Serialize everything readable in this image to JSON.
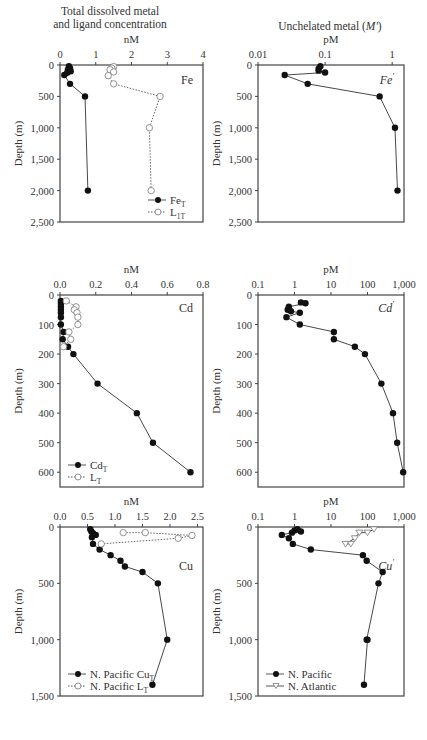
{
  "headers": {
    "left": [
      "Total dissolved metal",
      "and ligand concentration"
    ],
    "right_prefix": "Unchelated metal (",
    "right_symbol": "M'",
    "right_suffix": ")"
  },
  "chart_data": [
    {
      "id": "fe_total",
      "type": "line",
      "title": "Fe",
      "xlabel": "nM",
      "ylabel": "Depth (m)",
      "xscale": "linear",
      "xlim": [
        0,
        4
      ],
      "xticks": [
        0,
        1,
        2,
        3,
        4
      ],
      "ylim": [
        0,
        2500
      ],
      "yticks": [
        0,
        500,
        1000,
        1500,
        2000,
        2500
      ],
      "ytick_labels": [
        "0",
        "500",
        "1,000",
        "1,500",
        "2,000",
        "2,500"
      ],
      "legend_position": "lower right",
      "series": [
        {
          "name": "Fe_T",
          "marker": "filled-circle",
          "line": "solid",
          "x": [
            0.25,
            0.28,
            0.22,
            0.3,
            0.2,
            0.12,
            0.28,
            0.7,
            0.78
          ],
          "y": [
            20,
            50,
            75,
            100,
            125,
            160,
            300,
            500,
            2000
          ]
        },
        {
          "name": "L_1T",
          "marker": "open-circle",
          "line": "dotted",
          "x": [
            1.5,
            1.45,
            1.4,
            1.5,
            1.35,
            1.5,
            2.8,
            2.5,
            2.55
          ],
          "y": [
            25,
            50,
            75,
            110,
            170,
            300,
            500,
            1000,
            2000
          ]
        }
      ]
    },
    {
      "id": "fe_free",
      "type": "line",
      "title": "Fe'",
      "xlabel": "pM",
      "ylabel": "Depth (m)",
      "xscale": "log",
      "xlim": [
        0.01,
        1.5
      ],
      "xticks": [
        0.01,
        0.1,
        1
      ],
      "xtick_labels": [
        "0.01",
        "0.1",
        "1"
      ],
      "ylim": [
        0,
        2500
      ],
      "yticks": [
        0,
        500,
        1000,
        1500,
        2000,
        2500
      ],
      "ytick_labels": [
        "0",
        "500",
        "1,000",
        "1,500",
        "2,000",
        "2,500"
      ],
      "series": [
        {
          "name": "Fe'",
          "marker": "filled-circle",
          "line": "solid",
          "x": [
            0.085,
            0.08,
            0.08,
            0.1,
            0.025,
            0.055,
            0.65,
            1.1,
            1.2
          ],
          "y": [
            20,
            60,
            90,
            120,
            160,
            300,
            500,
            1000,
            2000
          ]
        }
      ]
    },
    {
      "id": "cd_total",
      "type": "line",
      "title": "Cd",
      "xlabel": "nM",
      "ylabel": "Depth (m)",
      "xscale": "linear",
      "xlim": [
        0,
        0.8
      ],
      "xticks": [
        0.0,
        0.2,
        0.4,
        0.6,
        0.8
      ],
      "xtick_labels": [
        "0.0",
        "0.2",
        "0.4",
        "0.6",
        "0.8"
      ],
      "ylim": [
        0,
        650
      ],
      "yticks": [
        0,
        100,
        200,
        300,
        400,
        500,
        600
      ],
      "legend_position": "lower left",
      "series": [
        {
          "name": "Cd_T",
          "marker": "filled-circle",
          "line": "solid",
          "x": [
            0.005,
            0.005,
            0.005,
            0.005,
            0.005,
            0.005,
            0.005,
            0.02,
            0.015,
            0.045,
            0.075,
            0.21,
            0.43,
            0.52,
            0.73
          ],
          "y": [
            20,
            30,
            40,
            50,
            60,
            75,
            100,
            125,
            150,
            175,
            200,
            300,
            400,
            500,
            600
          ]
        },
        {
          "name": "L_T",
          "marker": "open-circle",
          "line": "dotted",
          "x": [
            0.035,
            0.09,
            0.08,
            0.095,
            0.1,
            0.1,
            0.05,
            0.06,
            0.02
          ],
          "y": [
            20,
            40,
            50,
            60,
            75,
            100,
            125,
            150,
            175
          ]
        }
      ]
    },
    {
      "id": "cd_free",
      "type": "line",
      "title": "Cd'",
      "xlabel": "pM",
      "ylabel": "Depth (m)",
      "xscale": "log",
      "xlim": [
        0.1,
        1000
      ],
      "xticks": [
        0.1,
        1,
        10,
        100,
        1000
      ],
      "xtick_labels": [
        "0.1",
        "1",
        "10",
        "100",
        "1,000"
      ],
      "ylim": [
        0,
        650
      ],
      "yticks": [
        0,
        100,
        200,
        300,
        400,
        500,
        600
      ],
      "series": [
        {
          "name": "Cd'",
          "marker": "filled-circle",
          "line": "solid",
          "x": [
            1.5,
            2.0,
            0.7,
            0.65,
            0.8,
            1.4,
            0.6,
            1.4,
            12,
            12,
            45,
            85,
            240,
            500,
            650,
            950
          ],
          "y": [
            25,
            28,
            40,
            50,
            55,
            60,
            75,
            100,
            125,
            150,
            175,
            200,
            300,
            400,
            500,
            600
          ]
        }
      ]
    },
    {
      "id": "cu_total",
      "type": "line",
      "title": "Cu",
      "xlabel": "nM",
      "ylabel": "Depth (m)",
      "xscale": "linear",
      "xlim": [
        0,
        2.6
      ],
      "xticks": [
        0.0,
        0.5,
        1.0,
        1.5,
        2.0,
        2.5
      ],
      "xtick_labels": [
        "0.0",
        "0.5",
        "1.0",
        "1.5",
        "2.0",
        "2.5"
      ],
      "ylim": [
        0,
        1500
      ],
      "yticks": [
        0,
        500,
        1000,
        1500
      ],
      "ytick_labels": [
        "0",
        "500",
        "1,000",
        "1,500"
      ],
      "legend_position": "lower left",
      "series": [
        {
          "name": "N. Pacific Cu_T",
          "marker": "filled-circle",
          "line": "solid",
          "x": [
            0.55,
            0.57,
            0.6,
            0.65,
            0.58,
            0.6,
            0.72,
            0.92,
            1.1,
            1.18,
            1.5,
            1.78,
            1.95,
            1.68
          ],
          "y": [
            20,
            40,
            55,
            70,
            90,
            150,
            200,
            250,
            300,
            350,
            400,
            500,
            1000,
            1400
          ]
        },
        {
          "name": "N. Pacific L_T",
          "marker": "open-circle",
          "line": "dotted",
          "x": [
            1.15,
            1.55,
            2.4,
            2.15,
            0.75
          ],
          "y": [
            50,
            50,
            75,
            100,
            150
          ]
        }
      ]
    },
    {
      "id": "cu_free",
      "type": "line",
      "title": "Cu'",
      "xlabel": "pM",
      "ylabel": "Depth (m)",
      "xscale": "log",
      "xlim": [
        0.1,
        1000
      ],
      "xticks": [
        0.1,
        1,
        10,
        100,
        1000
      ],
      "xtick_labels": [
        "0.1",
        "1",
        "10",
        "100",
        "1,000"
      ],
      "ylim": [
        0,
        1500
      ],
      "yticks": [
        0,
        500,
        1000,
        1500
      ],
      "ytick_labels": [
        "0",
        "500",
        "1,000",
        "1,500"
      ],
      "legend_position": "lower left",
      "series": [
        {
          "name": "N. Pacific",
          "marker": "filled-circle",
          "line": "solid",
          "x": [
            1.0,
            1.2,
            1.5,
            0.85,
            0.45,
            0.7,
            0.9,
            2.8,
            75,
            95,
            260,
            200,
            95,
            100,
            80
          ],
          "y": [
            30,
            20,
            40,
            50,
            70,
            100,
            150,
            200,
            250,
            300,
            400,
            500,
            1000,
            1000,
            1400
          ]
        },
        {
          "name": "N. Atlantic",
          "marker": "open-triangle-down",
          "line": "solid",
          "x": [
            150,
            100,
            60,
            45,
            25,
            35
          ],
          "y": [
            20,
            50,
            50,
            100,
            150,
            150
          ]
        }
      ]
    }
  ],
  "panels": {
    "fe_total": {
      "xlabel": "nM",
      "ticks": [
        "0",
        "1",
        "2",
        "3",
        "4"
      ],
      "title": "Fe",
      "yticks": [
        "0",
        "500",
        "1,000",
        "1,500",
        "2,000",
        "2,500"
      ],
      "ylabel": "Depth (m)",
      "legend": [
        "Fe",
        "L"
      ],
      "legend_sub": [
        "T",
        "1T"
      ]
    },
    "fe_free": {
      "xlabel": "pM",
      "ticks": [
        "0.01",
        "0.1",
        "1"
      ],
      "title": "Fe",
      "yticks": [
        "0",
        "500",
        "1,000",
        "1,500",
        "2,000",
        "2,500"
      ],
      "ylabel": "Depth (m)"
    },
    "cd_total": {
      "xlabel": "nM",
      "ticks": [
        "0.0",
        "0.2",
        "0.4",
        "0.6",
        "0.8"
      ],
      "title": "Cd",
      "yticks": [
        "0",
        "100",
        "200",
        "300",
        "400",
        "500",
        "600"
      ],
      "ylabel": "Depth (m)",
      "legend": [
        "Cd",
        "L"
      ],
      "legend_sub": [
        "T",
        "T"
      ]
    },
    "cd_free": {
      "xlabel": "pM",
      "ticks": [
        "0.1",
        "1",
        "10",
        "100",
        "1,000"
      ],
      "title": "Cd",
      "yticks": [
        "0",
        "100",
        "200",
        "300",
        "400",
        "500",
        "600"
      ],
      "ylabel": "Depth (m)"
    },
    "cu_total": {
      "xlabel": "nM",
      "ticks": [
        "0.0",
        "0.5",
        "1.0",
        "1.5",
        "2.0",
        "2.5"
      ],
      "title": "Cu",
      "yticks": [
        "0",
        "500",
        "1,000",
        "1,500"
      ],
      "ylabel": "Depth (m)",
      "legend": [
        "N. Pacific Cu",
        "N. Pacific L"
      ],
      "legend_sub": [
        "T",
        "T"
      ]
    },
    "cu_free": {
      "xlabel": "pM",
      "ticks": [
        "0.1",
        "1",
        "10",
        "100",
        "1,000"
      ],
      "title": "Cu",
      "yticks": [
        "0",
        "500",
        "1,000",
        "1,500"
      ],
      "ylabel": "Depth (m)",
      "legend": [
        "N. Pacific",
        "N. Atlantic"
      ]
    }
  }
}
